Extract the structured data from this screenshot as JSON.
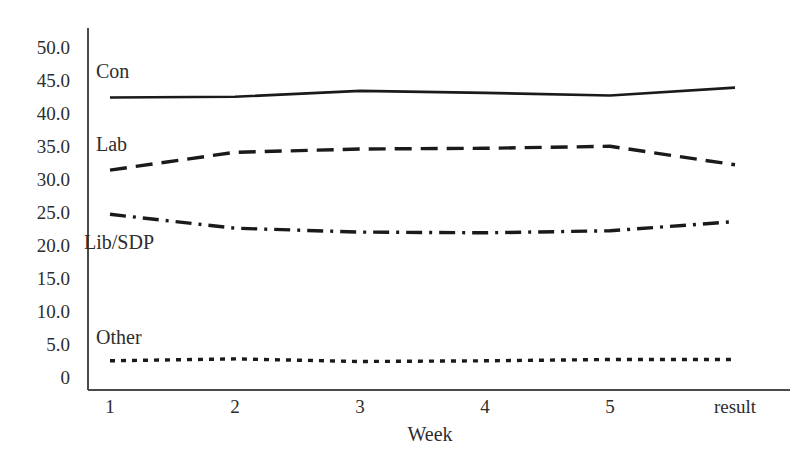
{
  "chart_data": {
    "type": "line",
    "title": "",
    "subtitle": "",
    "xlabel": "Week",
    "ylabel": "",
    "categories": [
      "1",
      "2",
      "3",
      "4",
      "5",
      "result"
    ],
    "x_tick_labels": [
      "1",
      "2",
      "3",
      "4",
      "5",
      "result"
    ],
    "y_tick_labels": [
      "50.0",
      "45.0",
      "40.0",
      "35.0",
      "30.0",
      "25.0",
      "20.0",
      "15.0",
      "10.0",
      "5.0",
      "0"
    ],
    "y_tick_values": [
      50,
      45,
      40,
      35,
      30,
      25,
      20,
      15,
      10,
      5,
      0
    ],
    "ylim": [
      0,
      52
    ],
    "xlim": [
      0,
      5
    ],
    "grid": false,
    "legend_position": "inline-left-of-series",
    "series": [
      {
        "name": "Con",
        "label": "Con",
        "style": "solid",
        "color": "#1a1a1a",
        "values": [
          42.5,
          42.6,
          43.5,
          43.2,
          42.8,
          44.0
        ]
      },
      {
        "name": "Lab",
        "label": "Lab",
        "style": "dashed",
        "color": "#1a1a1a",
        "values": [
          31.5,
          34.2,
          34.7,
          34.8,
          35.1,
          32.3
        ]
      },
      {
        "name": "Lib/SDP",
        "label": "Lib/SDP",
        "style": "dash-dot",
        "color": "#1a1a1a",
        "values": [
          24.8,
          22.7,
          22.1,
          22.0,
          22.3,
          23.7
        ]
      },
      {
        "name": "Other",
        "label": "Other",
        "style": "dotted",
        "color": "#1a1a1a",
        "values": [
          2.6,
          2.9,
          2.5,
          2.6,
          2.8,
          2.8
        ]
      }
    ],
    "series_label_positions": [
      {
        "name": "Con",
        "x": 96,
        "y": 61
      },
      {
        "name": "Lab",
        "x": 96,
        "y": 134
      },
      {
        "name": "Lib/SDP",
        "x": 84,
        "y": 232
      },
      {
        "name": "Other",
        "x": 96,
        "y": 327
      }
    ],
    "axis_color": "#4a4a4a"
  }
}
